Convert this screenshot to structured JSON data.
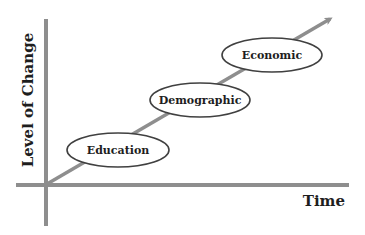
{
  "diagram": {
    "type": "progression-along-time",
    "x_axis_label": "Time",
    "y_axis_label": "Level of Change",
    "stages": [
      {
        "label": "Education",
        "cx": 118,
        "cy": 150,
        "rx": 51,
        "ry": 17
      },
      {
        "label": "Demographic",
        "cx": 200,
        "cy": 100,
        "rx": 50,
        "ry": 17
      },
      {
        "label": "Economic",
        "cx": 272,
        "cy": 55,
        "rx": 50,
        "ry": 17
      }
    ],
    "colors": {
      "axis": "#8e8e8e",
      "trend_line": "#8e8e8e",
      "ellipse_stroke": "#404040",
      "ellipse_fill": "#ffffff",
      "text": "#1e1e1e"
    }
  }
}
